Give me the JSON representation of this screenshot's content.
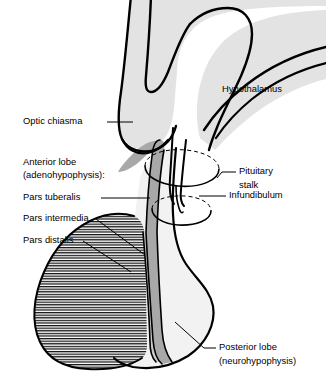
{
  "figure": {
    "background_color": "#ffffff",
    "line_color": "#000000"
  },
  "colors": {
    "hypothalamus_fill": "#e3e3e3",
    "posterior_lobe_fill": "#f2f2f2",
    "pars_tuberalis_fill": "#a8a8a8",
    "pars_intermedia_fill": "#c9c9c9",
    "pars_distalis_hatch": "#000000",
    "outline": "#000000"
  },
  "labels": {
    "hypothalamus": "Hypothalamus",
    "optic_chiasma": "Optic chiasma",
    "anterior_lobe_line1": "Anterior lobe",
    "anterior_lobe_line2": "(adenohypophysis):",
    "pars_tuberalis": "Pars tuberalis",
    "pars_intermedia": "Pars intermedia",
    "pars_distalis": "Pars distalis",
    "pituitary_stalk_line1": "Pituitary",
    "pituitary_stalk_line2": "stalk",
    "infundibulum": "Infundibulum",
    "posterior_lobe_line1": "Posterior lobe",
    "posterior_lobe_line2": "(neurohypophysis)"
  }
}
